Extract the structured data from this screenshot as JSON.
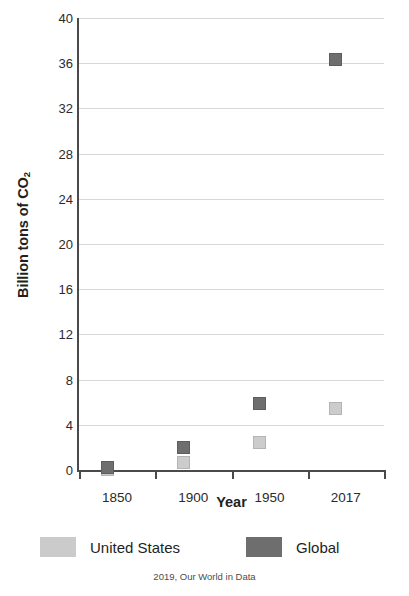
{
  "chart_data": {
    "type": "scatter",
    "title": "",
    "xlabel": "Year",
    "ylabel": "Billion tons of CO₂",
    "ylabel_main": "Billion tons of CO",
    "ylabel_sub": "2",
    "categories": [
      "1850",
      "1900",
      "1950",
      "2017"
    ],
    "x_positions": [
      0,
      1,
      2,
      3
    ],
    "ylim": [
      0,
      40
    ],
    "yticks": [
      0,
      4,
      8,
      12,
      16,
      20,
      24,
      28,
      32,
      36,
      40
    ],
    "ytick_labels": [
      "0",
      "4",
      "8",
      "12",
      "16",
      "20",
      "24",
      "28",
      "32",
      "36",
      "40"
    ],
    "grid": true,
    "legend_position": "bottom",
    "series": [
      {
        "name": "United States",
        "color": "#cbcbcb",
        "values": [
          0.02,
          0.66,
          2.45,
          5.4
        ]
      },
      {
        "name": "Global",
        "color": "#6e6e6e",
        "values": [
          0.2,
          2.0,
          5.85,
          36.3
        ]
      }
    ]
  },
  "legend": {
    "items": [
      {
        "label": "United States",
        "color": "#cbcbcb",
        "swatch_name": "legend-swatch-united-states"
      },
      {
        "label": "Global",
        "color": "#6e6e6e",
        "swatch_name": "legend-swatch-global"
      }
    ]
  },
  "footer": {
    "source": "2019, Our World in Data"
  }
}
